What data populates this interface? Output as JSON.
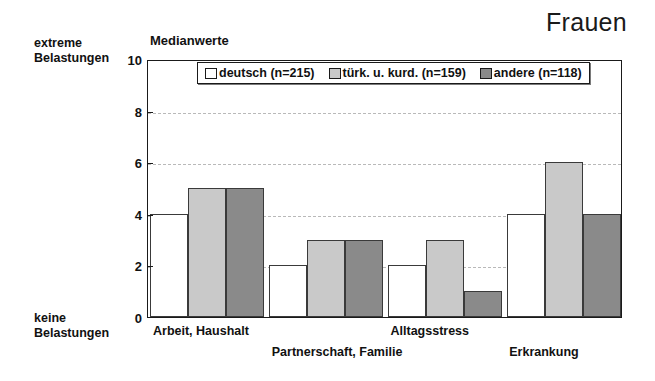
{
  "figure": {
    "title": "Frauen",
    "axis_caption": "Medianwerte",
    "pole_high_line1": "extreme",
    "pole_high_line2": "Belastungen",
    "pole_low_line1": "keine",
    "pole_low_line2": "Belastungen"
  },
  "legend": {
    "entries": [
      {
        "label": "deutsch (n=215)",
        "color": "#ffffff"
      },
      {
        "label": "türk. u. kurd. (n=159)",
        "color": "#c9c9c9"
      },
      {
        "label": "andere (n=118)",
        "color": "#8a8a8a"
      }
    ]
  },
  "chart_data": {
    "type": "bar",
    "title": "Frauen",
    "subtitle": "Medianwerte",
    "xlabel": "",
    "ylabel": "Medianwerte",
    "ylim": [
      0,
      10
    ],
    "yticks": [
      0,
      2,
      4,
      6,
      8,
      10
    ],
    "ytick_labels": [
      "0",
      "2",
      "4",
      "6",
      "8",
      "10"
    ],
    "grid": "horizontal-dashed",
    "gridlines_at": [
      2,
      4,
      6,
      8
    ],
    "legend_position": "inside-top-center",
    "axis_annotations": {
      "top": "extreme Belastungen",
      "bottom": "keine Belastungen"
    },
    "categories": [
      "Arbeit, Haushalt",
      "Partnerschaft, Familie",
      "Alltagsstress",
      "Erkrankung"
    ],
    "series": [
      {
        "name": "deutsch (n=215)",
        "color": "#ffffff",
        "values": [
          4,
          2,
          2,
          4
        ]
      },
      {
        "name": "türk. u. kurd. (n=159)",
        "color": "#c9c9c9",
        "values": [
          5,
          3,
          3,
          6
        ]
      },
      {
        "name": "andere (n=118)",
        "color": "#8a8a8a",
        "values": [
          5,
          3,
          1,
          4
        ]
      }
    ]
  },
  "category_labels": [
    {
      "text": "Arbeit, Haushalt",
      "row": 0
    },
    {
      "text": "Partnerschaft, Familie",
      "row": 1
    },
    {
      "text": "Alltagsstress",
      "row": 0
    },
    {
      "text": "Erkrankung",
      "row": 1
    }
  ]
}
